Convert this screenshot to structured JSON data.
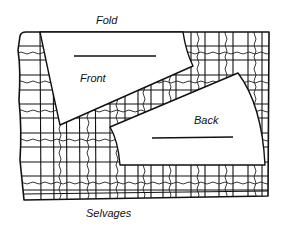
{
  "figure": {
    "type": "sewing-pattern-layout",
    "labels": {
      "fold": "Fold",
      "selvages": "Selvages",
      "front": "Front",
      "back": "Back"
    },
    "colors": {
      "ink": "#111111",
      "paper": "#ffffff"
    },
    "pieces": [
      {
        "name": "Front",
        "has_grainline": true
      },
      {
        "name": "Back",
        "has_grainline": true
      }
    ],
    "fabric": {
      "pattern": "plaid",
      "top_edge": "Fold",
      "bottom_edge": "Selvages"
    }
  }
}
